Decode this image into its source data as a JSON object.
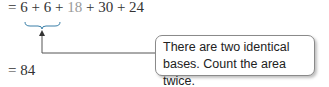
{
  "equation_line1": {
    "prefix": "= ",
    "term1": "6",
    "op1": " + ",
    "term2": "6",
    "op2": " + ",
    "term3": "18",
    "op3": " + ",
    "term4": "30",
    "op4": " + ",
    "term5": "24"
  },
  "equation_line2": "= 84",
  "callout": {
    "line1": "There are two identical",
    "line2": "bases. Count the area twice."
  },
  "colors": {
    "text": "#333333",
    "muted_term": "#9a9a9a",
    "border": "#8a8a8a"
  }
}
